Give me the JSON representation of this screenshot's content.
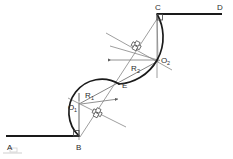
{
  "figure": {
    "background_color": "#ffffff",
    "line_color": "#1a1a1a",
    "construction_color": "#7d7d7d",
    "label_color": "#2b2b2b",
    "width": 233,
    "height": 159
  },
  "labels": {
    "point_a": "A",
    "point_b": "B",
    "point_c": "C",
    "point_d": "D",
    "point_e": "E",
    "center_1_base": "O",
    "center_1_sub": "1",
    "center_2_base": "O",
    "center_2_sub": "2",
    "radius_1_base": "R",
    "radius_1_sub": "1",
    "radius_2_base": "R",
    "radius_2_sub": "2"
  },
  "geometry": {
    "tangent_ab": {
      "from": [
        6,
        136
      ],
      "to": [
        79,
        136
      ]
    },
    "tangent_cd": {
      "from": [
        157,
        14
      ],
      "to": [
        222,
        14
      ]
    },
    "center_o1": [
      79,
      104
    ],
    "center_o2": [
      158,
      60
    ],
    "point_b": [
      79,
      136
    ],
    "point_c": [
      157,
      14
    ],
    "point_e": [
      119,
      84
    ],
    "radius_1_value": "R1",
    "radius_2_value": "R2"
  }
}
